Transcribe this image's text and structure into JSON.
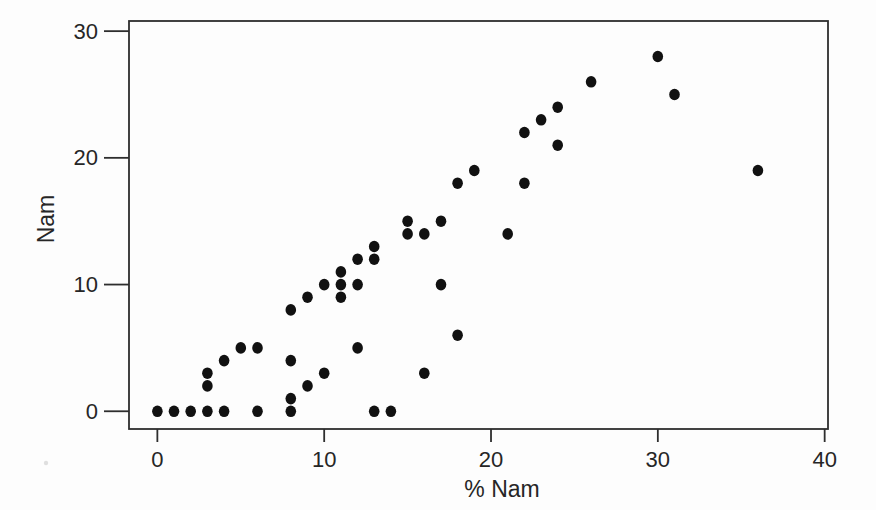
{
  "figure": {
    "background": "#fdfdfd",
    "ink": "#111111",
    "axis_color": "#2e2e2e",
    "text_color": "#262626"
  },
  "chart_data": {
    "type": "scatter",
    "title": "",
    "xlabel": "% Nam",
    "ylabel": "Nam",
    "xlim": [
      -1.7,
      40.2
    ],
    "ylim": [
      -1.4,
      30.8
    ],
    "x_ticks": [
      0,
      10,
      20,
      30,
      40
    ],
    "y_ticks": [
      0,
      10,
      20,
      30
    ],
    "grid": false,
    "legend": null,
    "marker": {
      "shape": "circle",
      "radius_px": 5.5,
      "color": "#111111"
    },
    "points": [
      [
        0,
        0
      ],
      [
        1,
        0
      ],
      [
        2,
        0
      ],
      [
        3,
        0
      ],
      [
        4,
        0
      ],
      [
        6,
        0
      ],
      [
        8,
        0
      ],
      [
        13,
        0
      ],
      [
        14,
        0
      ],
      [
        8,
        1
      ],
      [
        3,
        2
      ],
      [
        9,
        2
      ],
      [
        3,
        3
      ],
      [
        10,
        3
      ],
      [
        16,
        3
      ],
      [
        4,
        4
      ],
      [
        8,
        4
      ],
      [
        5,
        5
      ],
      [
        6,
        5
      ],
      [
        12,
        5
      ],
      [
        18,
        6
      ],
      [
        8,
        8
      ],
      [
        9,
        9
      ],
      [
        11,
        9
      ],
      [
        10,
        10
      ],
      [
        11,
        10
      ],
      [
        12,
        10
      ],
      [
        17,
        10
      ],
      [
        11,
        11
      ],
      [
        12,
        12
      ],
      [
        13,
        12
      ],
      [
        13,
        13
      ],
      [
        15,
        14
      ],
      [
        16,
        14
      ],
      [
        21,
        14
      ],
      [
        15,
        15
      ],
      [
        17,
        15
      ],
      [
        18,
        18
      ],
      [
        22,
        18
      ],
      [
        19,
        19
      ],
      [
        36,
        19
      ],
      [
        24,
        21
      ],
      [
        22,
        22
      ],
      [
        23,
        23
      ],
      [
        24,
        24
      ],
      [
        31,
        25
      ],
      [
        26,
        26
      ],
      [
        30,
        28
      ]
    ]
  }
}
